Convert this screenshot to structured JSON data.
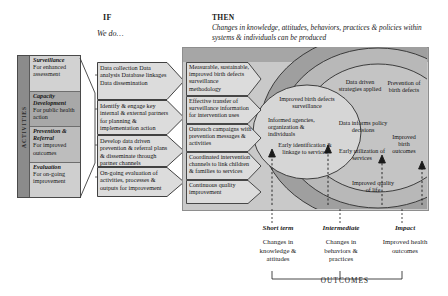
{
  "header": {
    "if_label": "IF",
    "if_sub": "We do…",
    "then_label": "THEN",
    "then_sub": "Changes in knowledge, attitudes, behaviors, practices & policies within systems & individuals can be produced"
  },
  "activities": {
    "spine_label": "ACTIVITIES",
    "items": [
      {
        "title": "Surveillance",
        "sub": "For enhanced assessment"
      },
      {
        "title": "Capacity Development",
        "sub": "For public health action"
      },
      {
        "title": "Prevention & Referral",
        "sub": "For improved outcomes"
      },
      {
        "title": "Evaluation",
        "sub": "For on-going improvement"
      }
    ]
  },
  "inputs": [
    "Data collection\nData analysis\nDatabase linkages\nData dissemination",
    "Identify & engage key internal & external partners for planning & implementation action",
    "Develop data driven prevention & referral plans & disseminate through partner channels",
    "On-going evaluation of activities, processes & outputs for improvement"
  ],
  "outputs": [
    "Measurable, sustainable, improved birth defects surveillance methodology",
    "Effective transfer of surveillance information for intervention uses",
    "Outreach campaigns with prevention messages & activities",
    "Coordinated intervention channels to link children & families to services",
    "Continuous quality improvement"
  ],
  "ovals": {
    "short_term": [
      "Improved birth defects surveillance",
      "Informed agencies, organization & individuals",
      "Early identification & linkage to services"
    ],
    "intermediate": [
      "Data driven strategies applied",
      "Data informs policy decisions",
      "Early utilization of services"
    ],
    "impact": [
      "Prevention of birth defects",
      "Improved birth outcomes",
      "Improved quality of life"
    ]
  },
  "outcomes": {
    "title": "OUTCOMES",
    "columns": [
      {
        "stage": "Short term",
        "detail": "Changes in knowledge & attitudes"
      },
      {
        "stage": "Intermediate",
        "detail": "Changes in behaviors & practices"
      },
      {
        "stage": "Impact",
        "detail": "Improved health outcomes"
      }
    ]
  },
  "colors": {
    "panel_bg": "#c9c9c9",
    "panel_top": "#a6a6a6",
    "oval_outer": "#9a9a9a",
    "oval_mid": "#b5b5b5",
    "oval_inner": "#d2d2d2",
    "chevron_fill": "#dcdcdc",
    "activity_bar": "#8b8b8b"
  }
}
